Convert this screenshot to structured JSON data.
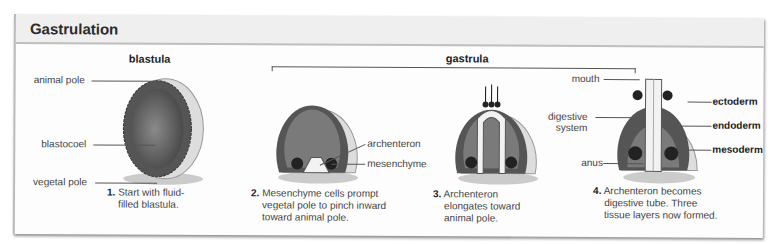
{
  "header": {
    "title": "Gastrulation"
  },
  "stages": {
    "blastula": "blastula",
    "gastrula": "gastrula"
  },
  "labels": {
    "animal_pole": "animal pole",
    "blastocoel": "blastocoel",
    "vegetal_pole": "vegetal pole",
    "archenteron": "archenteron",
    "mesenchyme": "mesenchyme",
    "mouth": "mouth",
    "digestive_system_1": "digestive",
    "digestive_system_2": "system",
    "anus": "anus",
    "ectoderm": "ectoderm",
    "endoderm": "endoderm",
    "mesoderm": "mesoderm"
  },
  "steps": [
    {
      "num": "1.",
      "lines": [
        "Start with fluid-",
        "filled blastula."
      ]
    },
    {
      "num": "2.",
      "lines": [
        "Mesenchyme cells prompt",
        "vegetal pole to pinch inward",
        "toward animal pole."
      ]
    },
    {
      "num": "3.",
      "lines": [
        "Archenteron",
        "elongates toward",
        "animal pole."
      ]
    },
    {
      "num": "4.",
      "lines": [
        "Archenteron becomes",
        "digestive tube. Three",
        "tissue layers now formed."
      ]
    }
  ]
}
